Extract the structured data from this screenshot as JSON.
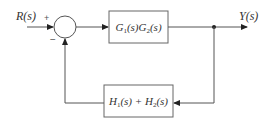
{
  "diagram": {
    "type": "block-diagram",
    "input": {
      "label": "R(s)"
    },
    "output": {
      "label": "Y(s)"
    },
    "summing_junction": {
      "signs": {
        "plus": "+",
        "minus": "−"
      }
    },
    "forward_block": {
      "label": "G1(s)G2(s)",
      "parts": [
        "G",
        "1",
        "(s)G",
        "2",
        "(s)"
      ]
    },
    "feedback_block": {
      "label": "H1(s) + H2(s)",
      "parts": [
        "H",
        "1",
        "(s) + H",
        "2",
        "(s)"
      ]
    },
    "colors": {
      "line": "#555555",
      "box": "#666666",
      "text": "#333333"
    }
  }
}
